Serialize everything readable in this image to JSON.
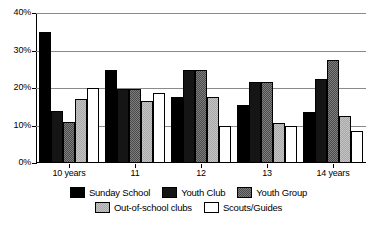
{
  "chart_data": {
    "type": "bar",
    "title": "",
    "subtitle": "",
    "xlabel": "",
    "ylabel": "",
    "categories": [
      "10 years",
      "11",
      "12",
      "13",
      "14 years"
    ],
    "series": [
      {
        "name": "Sunday School",
        "values": [
          35.0,
          24.8,
          17.5,
          15.6,
          13.5
        ]
      },
      {
        "name": "Youth Club",
        "values": [
          14.0,
          19.8,
          24.7,
          21.6,
          22.5
        ]
      },
      {
        "name": "Youth Group",
        "values": [
          11.0,
          19.8,
          24.7,
          21.6,
          27.5
        ]
      },
      {
        "name": "Out-of-school clubs",
        "values": [
          17.0,
          16.5,
          17.5,
          10.6,
          12.5
        ]
      },
      {
        "name": "Scouts/Guides",
        "values": [
          20.0,
          18.8,
          9.9,
          9.8,
          8.6
        ]
      }
    ],
    "ylim": [
      0,
      40
    ],
    "yticks": [
      0,
      10,
      20,
      30,
      40
    ],
    "ytick_labels": [
      "0%",
      "10%",
      "20%",
      "30%",
      "40%"
    ],
    "grid": true,
    "grid_axis": "y",
    "legend_position": "bottom",
    "value_unit": "%"
  },
  "legend": {
    "rows": [
      [
        "Sunday School",
        "Youth Club",
        "Youth Group"
      ],
      [
        "Out-of-school clubs",
        "Scouts/Guides"
      ]
    ]
  },
  "colors": {
    "series_1": "#000000",
    "series_2": "#151515",
    "series_3": "#4b4b4b",
    "series_4": "#a9a9a9",
    "series_5": "#ffffff",
    "axis": "#000000",
    "gridline": "#8a8a8a",
    "background": "#ffffff"
  }
}
